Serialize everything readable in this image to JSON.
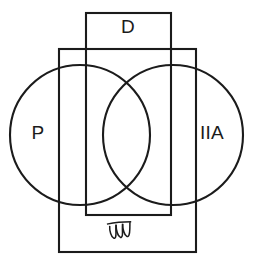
{
  "figure": {
    "background_color": "#ffffff",
    "stroke_color": "#1b1b1b",
    "stroke_width": 2.1,
    "width": 253,
    "height": 265
  },
  "sets": {
    "left_circle": {
      "label": "P",
      "label_x": 38,
      "label_y": 134,
      "cx": 80,
      "cy": 135,
      "r": 70
    },
    "right_circle": {
      "label": "IIA",
      "label_x": 212,
      "label_y": 134,
      "cx": 173,
      "cy": 135,
      "r": 70
    },
    "vertical_rect": {
      "label": "D",
      "label_x": 128,
      "label_y": 28,
      "x": 86,
      "y": 13,
      "width": 85,
      "height": 202
    },
    "outer_rect": {
      "label": "Ʒ",
      "label_x": 120,
      "label_y": 231,
      "x": 59,
      "y": 49,
      "width": 137,
      "height": 203
    }
  },
  "universe": {
    "symbol": "𝒲",
    "name": "universal-set-symbol",
    "x": 120,
    "y": 231
  },
  "legend_text": {
    "p": "P",
    "iia": "IIA",
    "d": "D",
    "universe": "𝒲"
  }
}
